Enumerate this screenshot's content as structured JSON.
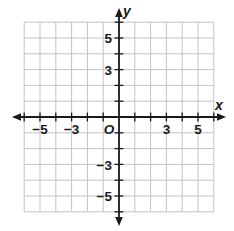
{
  "figure": {
    "type": "coordinate-plane",
    "grid": {
      "x_min": -6,
      "x_max": 6,
      "y_min": -6,
      "y_max": 6,
      "cell_size_units": 1,
      "grid_color": "#c3c3c3",
      "axis_color": "#1a1a1a"
    },
    "x_axis": {
      "label": "x",
      "ticks": [
        {
          "value": -5,
          "label": "−5"
        },
        {
          "value": -3,
          "label": "−3"
        },
        {
          "value": 3,
          "label": "3"
        },
        {
          "value": 5,
          "label": "5"
        }
      ]
    },
    "y_axis": {
      "label": "y",
      "ticks": [
        {
          "value": 5,
          "label": "5"
        },
        {
          "value": 3,
          "label": "3"
        },
        {
          "value": -3,
          "label": "−3"
        },
        {
          "value": -5,
          "label": "−5"
        }
      ]
    },
    "origin": {
      "label": "O"
    }
  }
}
